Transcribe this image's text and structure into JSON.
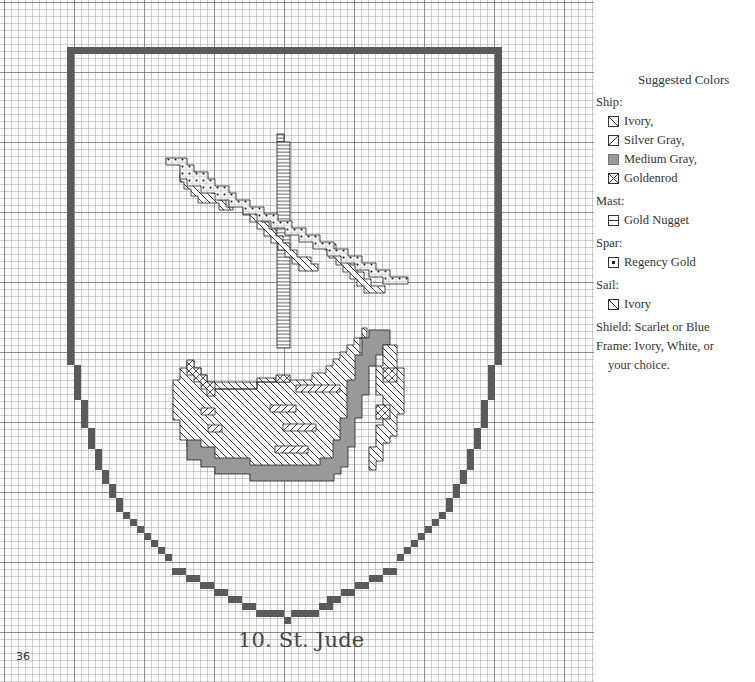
{
  "page": {
    "page_number": "36",
    "pattern_title": "10. St. Jude"
  },
  "legend": {
    "heading": "Suggested Colors",
    "groups": [
      {
        "label": "Ship:",
        "items": [
          {
            "symbol": "diagonal-backslash-icon",
            "color_name": "Ivory,"
          },
          {
            "symbol": "diagonal-slash-icon",
            "color_name": "Silver Gray,"
          },
          {
            "symbol": "filled-square-icon",
            "color_name": "Medium Gray,"
          },
          {
            "symbol": "crossed-square-icon",
            "color_name": "Goldenrod"
          }
        ]
      },
      {
        "label": "Mast:",
        "items": [
          {
            "symbol": "horizontal-line-icon",
            "color_name": "Gold Nugget"
          }
        ]
      },
      {
        "label": "Spar:",
        "items": [
          {
            "symbol": "center-dot-icon",
            "color_name": "Regency Gold"
          }
        ]
      },
      {
        "label": "Sail:",
        "items": [
          {
            "symbol": "diagonal-backslash-icon",
            "color_name": "Ivory"
          }
        ]
      }
    ],
    "notes": [
      {
        "text": "Shield: Scarlet or Blue"
      },
      {
        "text": "Frame: Ivory, White, or",
        "continuation": "your choice."
      }
    ]
  },
  "colors": {
    "frame": "#5a5a5a",
    "medium_gray": "#999999",
    "grid_line": "#999999",
    "outline": "#222222"
  }
}
